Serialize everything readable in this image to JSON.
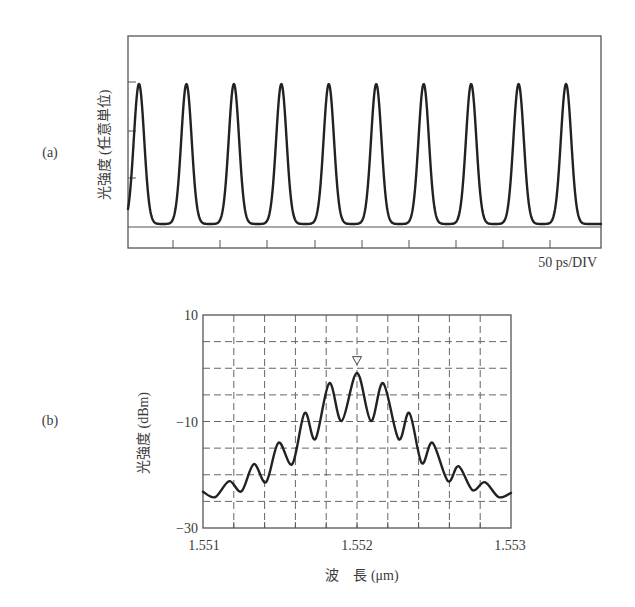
{
  "panels": {
    "a": {
      "label": "(a)"
    },
    "b": {
      "label": "(b)"
    }
  },
  "chart_data": [
    {
      "id": "a",
      "type": "line",
      "title": "",
      "xlabel": "50 ps/DIV",
      "ylabel": "光強度 (任意単位)",
      "x_unit": "ps",
      "x_per_div": 50,
      "x_divisions": 10,
      "description": "Periodic optical pulse train, 10 pulses visible, period approx. 50 ps",
      "pulse_count": 10,
      "pulse_period_ps": 50,
      "peak_times_ps": [
        12,
        62,
        112,
        162,
        212,
        262,
        312,
        362,
        412,
        462
      ],
      "peak_intensity_au": 1.0,
      "baseline_intensity_au": 0.0,
      "pulse_fwhm_ps": 10.5,
      "y_ticks_au": [
        0.33,
        0.67,
        1.0
      ],
      "xlim_ps": [
        0,
        500
      ],
      "grid": false
    },
    {
      "id": "b",
      "type": "line",
      "title": "",
      "xlabel": "波　長 (μm)",
      "ylabel": "光強度 (dBm)",
      "x_ticks": [
        "1.551",
        "1.552",
        "1.553"
      ],
      "y_ticks": [
        "10",
        "−10",
        "−30"
      ],
      "xlim": [
        1.551,
        1.553
      ],
      "ylim": [
        -30,
        10
      ],
      "grid": true,
      "grid_x_step": 0.0002,
      "grid_y_step": 5,
      "marker": {
        "symbol": "▽",
        "x": 1.552,
        "y": 0.3
      },
      "series": [
        {
          "name": "spectrum",
          "x": [
            1.551,
            1.55108,
            1.55117,
            1.55125,
            1.55133,
            1.55141,
            1.55149,
            1.55158,
            1.55166,
            1.55173,
            1.55182,
            1.5519,
            1.552,
            1.55209,
            1.55217,
            1.55227,
            1.55234,
            1.55242,
            1.55249,
            1.55259,
            1.55266,
            1.55275,
            1.55283,
            1.55292,
            1.553
          ],
          "y": [
            -23.2,
            -24.2,
            -21.2,
            -23.1,
            -18.0,
            -21.4,
            -14.0,
            -18.0,
            -8.4,
            -13.3,
            -2.8,
            -9.9,
            -0.9,
            -9.9,
            -2.8,
            -13.3,
            -8.4,
            -17.8,
            -14.0,
            -21.2,
            -18.4,
            -22.9,
            -21.4,
            -24.2,
            -23.4
          ]
        }
      ]
    }
  ],
  "layout": {
    "a": {
      "left": 128,
      "top": 36,
      "right": 601,
      "bottom": 248,
      "baseline": 227,
      "peak_y": 84,
      "first_peak_x": 139,
      "period_px": 47.45,
      "yticks_px": [
        82,
        131,
        178
      ],
      "xticks_px": [
        173,
        220,
        267,
        315,
        362,
        409,
        456,
        503,
        550
      ]
    },
    "b": {
      "left": 203,
      "top": 315,
      "right": 511,
      "bottom": 528
    }
  }
}
